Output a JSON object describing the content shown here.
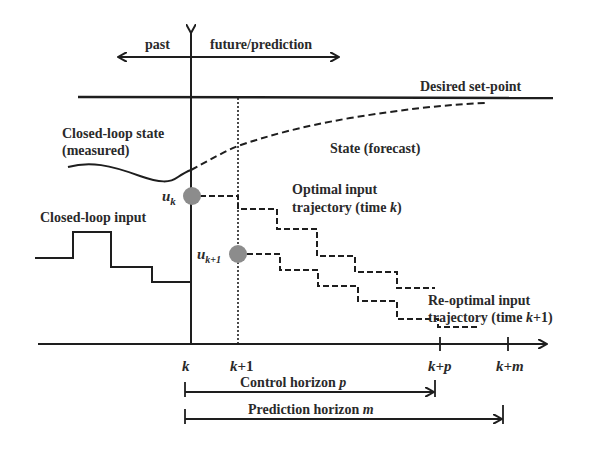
{
  "diagram": {
    "time_direction": {
      "past_label": "past",
      "future_label": "future/prediction"
    },
    "setpoint": {
      "label": "Desired set-point"
    },
    "state": {
      "measured_label_line1": "Closed-loop state",
      "measured_label_line2": "(measured)",
      "forecast_label": "State (forecast)"
    },
    "input": {
      "closed_loop_label": "Closed-loop input",
      "uk_symbol": "u",
      "uk_subscript": "k",
      "uk1_symbol": "u",
      "uk1_subscript": "k+1",
      "optimal_label_line1": "Optimal input",
      "optimal_label_line2": "trajectory (time ",
      "optimal_label_time": "k",
      "optimal_label_close": ")",
      "reoptimal_label_line1": "Re-optimal input",
      "reoptimal_label_line2": "trajectory (time ",
      "reoptimal_label_time": "k",
      "reoptimal_label_time_suffix": "+1)"
    },
    "time_axis": {
      "ticks": [
        {
          "label_var": "k",
          "label_rest": ""
        },
        {
          "label_var": "k",
          "label_rest": "+1"
        },
        {
          "label_var": "k",
          "label_rest": "+p"
        },
        {
          "label_var": "k",
          "label_rest": "+m"
        }
      ]
    },
    "horizons": {
      "control_label": "Control horizon ",
      "control_var": "p",
      "prediction_label": "Prediction horizon ",
      "prediction_var": "m"
    },
    "colors": {
      "line": "#1e1e1e",
      "marker": "#8c8c8c",
      "text": "#2a2a2a",
      "background": "#ffffff"
    }
  }
}
